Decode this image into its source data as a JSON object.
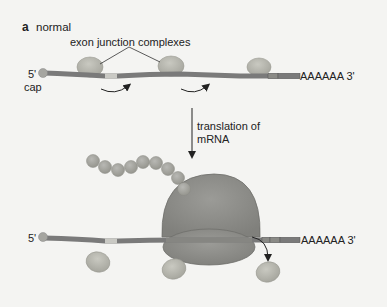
{
  "panel": {
    "letter": "a",
    "title": "normal"
  },
  "labels": {
    "ejc": "exon junction complexes",
    "five_prime_top": "5'",
    "cap": "cap",
    "polyA_top": "AAAAAA 3'",
    "translation_line1": "translation of",
    "translation_line2": "mRNA",
    "five_prime_bottom": "5'",
    "polyA_bottom": "AAAAAA 3'"
  },
  "elements": {
    "top_mrna": {
      "name": "mRNA with exon junction complexes",
      "ejc_count": 3
    },
    "ribosome": {
      "name": "ribosome translating mRNA"
    },
    "polypeptide": {
      "name": "nascent polypeptide chain",
      "bead_count": 9
    },
    "displaced_ejcs": {
      "count": 3
    }
  },
  "colors": {
    "background": "#f4f4f2",
    "mrna": "#7a7a7a",
    "mrna_light": "#c9c9c4",
    "ejc": "#b8b8b0",
    "ribosome": "#8e8e8a",
    "bead": "#a9a9a5",
    "text": "#222222"
  }
}
